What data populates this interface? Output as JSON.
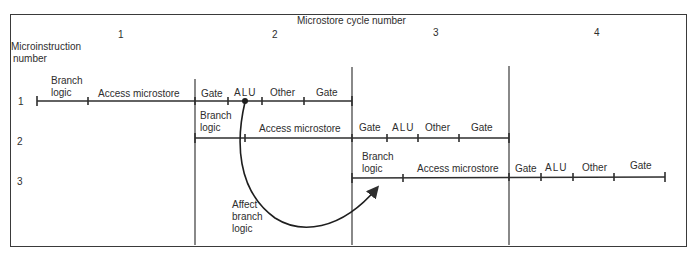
{
  "diagram": {
    "title": "Microstore cycle number",
    "y_axis_label": [
      "Microinstruction",
      "number"
    ],
    "cycles": [
      {
        "label": "1",
        "x": 120
      },
      {
        "label": "2",
        "x": 274
      },
      {
        "label": "3",
        "x": 434
      },
      {
        "label": "4",
        "x": 595
      }
    ],
    "cycle_dividers_x": [
      195,
      352,
      509
    ],
    "rows": [
      {
        "label": "1",
        "y": 101,
        "ticks": [
          37,
          88,
          195,
          228,
          262,
          304,
          352
        ],
        "segments": [
          {
            "label": "Branch logic",
            "lines": [
              "Branch",
              "logic"
            ],
            "x": 48
          },
          {
            "label": "Access microstore",
            "x": 98
          },
          {
            "label": "Gate",
            "x": 200
          },
          {
            "label": "ALU",
            "x": 233
          },
          {
            "label": "Other",
            "x": 270
          },
          {
            "label": "Gate",
            "x": 316
          }
        ]
      },
      {
        "label": "2",
        "y": 138,
        "ticks": [
          195,
          245,
          352,
          387,
          418,
          459,
          509
        ],
        "segments": [
          {
            "label": "Branch logic",
            "lines": [
              "Branch",
              "logic"
            ],
            "x": 200
          },
          {
            "label": "Access microstore",
            "x": 259
          },
          {
            "label": "Gate",
            "x": 359
          },
          {
            "label": "ALU",
            "x": 392
          },
          {
            "label": "Other",
            "x": 426
          },
          {
            "label": "Gate",
            "x": 470
          }
        ]
      },
      {
        "label": "3",
        "y": 178,
        "ticks": [
          352,
          403,
          509,
          541,
          573,
          614,
          665
        ],
        "segments": [
          {
            "label": "Branch logic",
            "lines": [
              "Branch",
              "logic"
            ],
            "x": 362
          },
          {
            "label": "Access microstore",
            "x": 417
          },
          {
            "label": "Gate",
            "x": 515
          },
          {
            "label": "ALU",
            "x": 545
          },
          {
            "label": "Other",
            "x": 582
          },
          {
            "label": "Gate",
            "x": 630
          }
        ]
      }
    ],
    "annotation": {
      "label": "Affect branch logic",
      "lines": [
        "Affect",
        "branch",
        "logic"
      ],
      "from": "row 1 ALU",
      "to": "row 3 Branch logic"
    },
    "colors": {
      "ink": "#2e2e2e",
      "background": "#ffffff"
    }
  }
}
